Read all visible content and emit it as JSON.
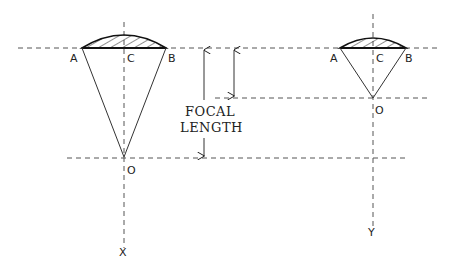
{
  "diagram": {
    "left_lens": {
      "labels": {
        "a": "A",
        "c": "C",
        "b": "B",
        "o": "O",
        "axis": "X"
      }
    },
    "right_lens": {
      "labels": {
        "a": "A",
        "c": "C",
        "b": "B",
        "o": "O",
        "axis": "Y"
      }
    },
    "dimension": {
      "label_line1": "FOCAL",
      "label_line2": "LENGTH"
    },
    "colors": {
      "line": "#333333",
      "dashed": "#555555",
      "background": "#ffffff"
    }
  }
}
